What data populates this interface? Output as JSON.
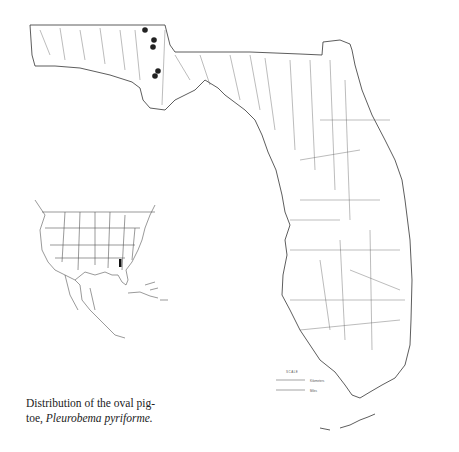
{
  "figure": {
    "caption_line1": "Distribution of the oval pig-",
    "caption_line2_prefix": "toe, ",
    "caption_species": "Pleurobema pyriforme.",
    "common_name": "oval pigtoe",
    "scientific_name": "Pleurobema pyriforme"
  },
  "main_map": {
    "region": "Florida",
    "line_color": "#333333",
    "occurrence_marker_color": "#222222",
    "occurrence_points": [
      {
        "x": 145,
        "y": 30
      },
      {
        "x": 154,
        "y": 40
      },
      {
        "x": 153,
        "y": 47
      },
      {
        "x": 158,
        "y": 71
      },
      {
        "x": 155,
        "y": 76
      }
    ]
  },
  "inset_map": {
    "region": "North America, Central America and Caribbean",
    "highlight_color": "#111111"
  },
  "scale_bar": {
    "title": "SCALE",
    "unit_top": "Kilometers",
    "unit_bottom": "Miles"
  }
}
